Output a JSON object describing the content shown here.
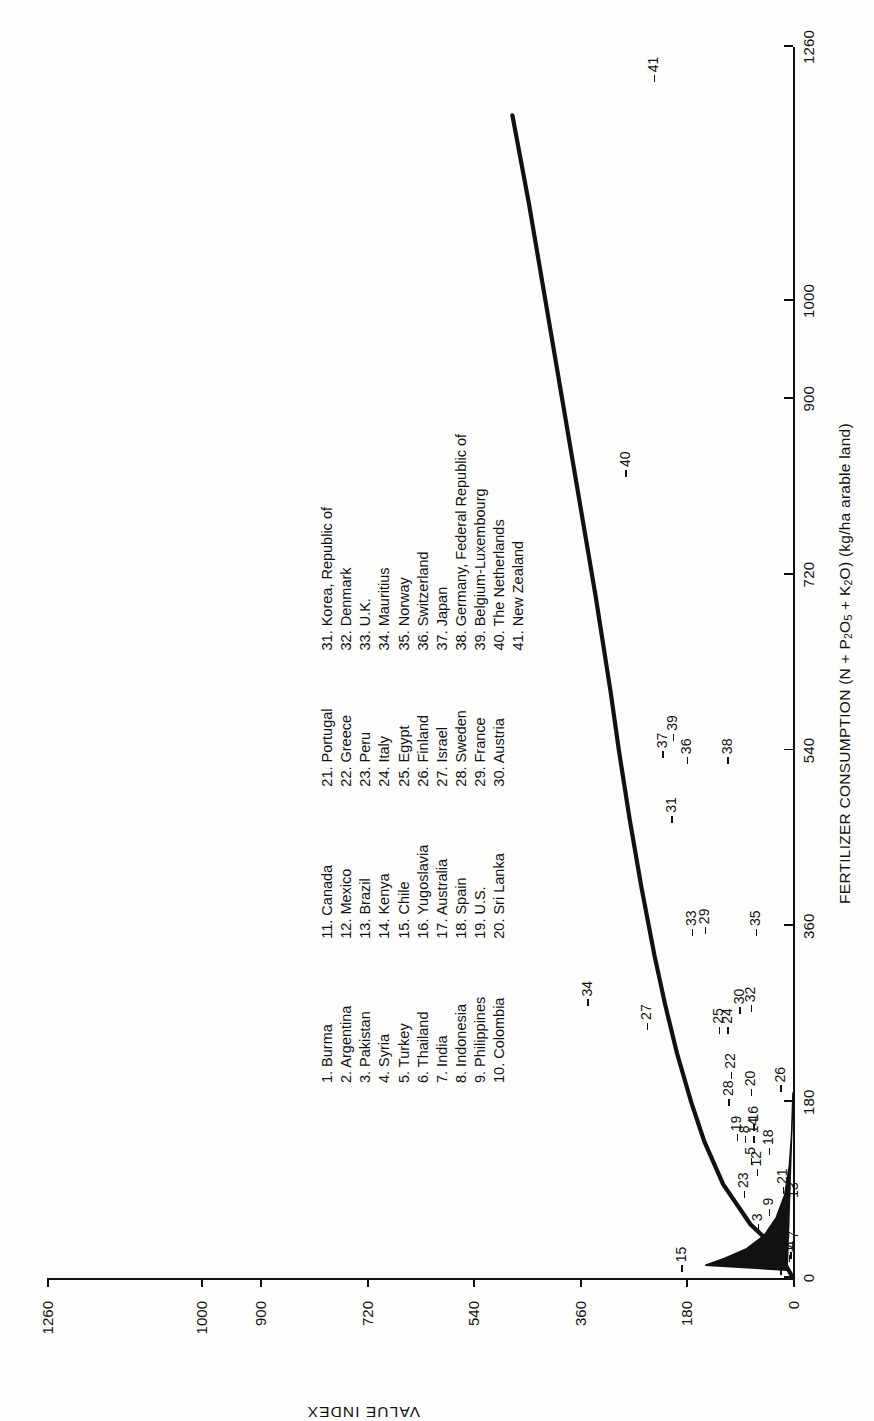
{
  "chart_data": {
    "type": "scatter",
    "title": "",
    "xlabel": "FERTILIZER CONSUMPTION (N + P2O5 + K2O) (kg/ha arable land)",
    "ylabel": "VALUE INDEX",
    "xticks": [
      0,
      180,
      360,
      540,
      720,
      900,
      1000,
      1260
    ],
    "yticks": [
      0,
      180,
      360,
      540,
      720,
      900,
      1000,
      1260
    ],
    "xlim": [
      0,
      1260
    ],
    "ylim": [
      0,
      1260
    ],
    "grid": false,
    "legend_position": "inside-center",
    "points": [
      {
        "id": 1,
        "label": "Burma",
        "x": 18,
        "y": 8
      },
      {
        "id": 2,
        "label": "Argentina",
        "x": 5,
        "y": 22
      },
      {
        "id": 3,
        "label": "Pakistan",
        "x": 50,
        "y": 60
      },
      {
        "id": 4,
        "label": "Syria",
        "x": 22,
        "y": 5
      },
      {
        "id": 5,
        "label": "Turkey",
        "x": 118,
        "y": 72
      },
      {
        "id": 6,
        "label": "Thailand",
        "x": 36,
        "y": 26
      },
      {
        "id": 7,
        "label": "India",
        "x": 32,
        "y": 0
      },
      {
        "id": 8,
        "label": "Indonesia",
        "x": 140,
        "y": 82
      },
      {
        "id": 9,
        "label": "Philippines",
        "x": 66,
        "y": 42
      },
      {
        "id": 10,
        "label": "Colombia",
        "x": 26,
        "y": 26
      },
      {
        "id": 11,
        "label": "Canada",
        "x": 34,
        "y": 20
      },
      {
        "id": 12,
        "label": "Mexico",
        "x": 106,
        "y": 62
      },
      {
        "id": 13,
        "label": "Brazil",
        "x": 74,
        "y": 0
      },
      {
        "id": 14,
        "label": "Kenya",
        "x": 140,
        "y": 68
      },
      {
        "id": 15,
        "label": "Chile",
        "x": 8,
        "y": 190
      },
      {
        "id": 16,
        "label": "Yugoslavia",
        "x": 152,
        "y": 68
      },
      {
        "id": 17,
        "label": "Australia",
        "x": 44,
        "y": 16
      },
      {
        "id": 18,
        "label": "Spain",
        "x": 128,
        "y": 42
      },
      {
        "id": 19,
        "label": "U.S.",
        "x": 142,
        "y": 96
      },
      {
        "id": 20,
        "label": "Sri Lanka",
        "x": 188,
        "y": 72
      },
      {
        "id": 21,
        "label": "Portugal",
        "x": 88,
        "y": 18
      },
      {
        "id": 22,
        "label": "Greece",
        "x": 206,
        "y": 106
      },
      {
        "id": 23,
        "label": "Peru",
        "x": 84,
        "y": 84
      },
      {
        "id": 24,
        "label": "Italy",
        "x": 252,
        "y": 112
      },
      {
        "id": 25,
        "label": "Egypt",
        "x": 252,
        "y": 126
      },
      {
        "id": 26,
        "label": "Finland",
        "x": 192,
        "y": 22
      },
      {
        "id": 27,
        "label": "Israel",
        "x": 256,
        "y": 248
      },
      {
        "id": 28,
        "label": "Sweden",
        "x": 178,
        "y": 110
      },
      {
        "id": 29,
        "label": "France",
        "x": 354,
        "y": 150
      },
      {
        "id": 30,
        "label": "Austria",
        "x": 272,
        "y": 92
      },
      {
        "id": 31,
        "label": "Korea, Republic of",
        "x": 468,
        "y": 206
      },
      {
        "id": 32,
        "label": "Denmark",
        "x": 274,
        "y": 72
      },
      {
        "id": 33,
        "label": "U.K.",
        "x": 352,
        "y": 172
      },
      {
        "id": 34,
        "label": "Mauritius",
        "x": 280,
        "y": 348
      },
      {
        "id": 35,
        "label": "Norway",
        "x": 352,
        "y": 64
      },
      {
        "id": 36,
        "label": "Switzerland",
        "x": 528,
        "y": 180
      },
      {
        "id": 37,
        "label": "Japan",
        "x": 534,
        "y": 222
      },
      {
        "id": 38,
        "label": "Germany, Federal Republic of",
        "x": 528,
        "y": 112
      },
      {
        "id": 39,
        "label": "Belgium-Luxembourg",
        "x": 552,
        "y": 204
      },
      {
        "id": 40,
        "label": "The Netherlands",
        "x": 822,
        "y": 284
      },
      {
        "id": 41,
        "label": "New Zealand",
        "x": 1226,
        "y": 236
      }
    ],
    "fit_curve": [
      [
        0,
        0
      ],
      [
        30,
        28
      ],
      [
        55,
        72
      ],
      [
        96,
        118
      ],
      [
        140,
        150
      ],
      [
        180,
        172
      ],
      [
        230,
        196
      ],
      [
        280,
        216
      ],
      [
        330,
        234
      ],
      [
        400,
        256
      ],
      [
        470,
        276
      ],
      [
        540,
        294
      ],
      [
        600,
        308
      ],
      [
        700,
        334
      ],
      [
        800,
        362
      ],
      [
        900,
        390
      ],
      [
        1000,
        418
      ],
      [
        1100,
        446
      ],
      [
        1190,
        474
      ]
    ],
    "origin_spike": [
      [
        8,
        10
      ],
      [
        13,
        148
      ],
      [
        20,
        116
      ],
      [
        30,
        78
      ],
      [
        44,
        48
      ],
      [
        62,
        28
      ],
      [
        85,
        14
      ],
      [
        115,
        6
      ],
      [
        150,
        2
      ],
      [
        190,
        0
      ]
    ]
  },
  "axes": {
    "x_title": "FERTILIZER CONSUMPTION (N + P",
    "x_title_sub1": "2",
    "x_title_mid": "O",
    "x_title_sub2": "5",
    "x_title_mid2": " + K",
    "x_title_sub3": "2",
    "x_title_end": "O) (kg/ha arable land)",
    "y_title": "VALUE INDEX",
    "x_tick_labels": [
      "0",
      "180",
      "360",
      "540",
      "720",
      "900",
      "1000",
      "1260"
    ],
    "y_tick_labels": [
      "0",
      "180",
      "360",
      "540",
      "720",
      "900",
      "1000",
      "1260"
    ]
  },
  "legend": {
    "columns": [
      {
        "items": [
          "1. Burma",
          "2. Argentina",
          "3. Pakistan",
          "4. Syria",
          "5. Turkey",
          "6. Thailand",
          "7. India",
          "8. Indonesia",
          "9. Philippines",
          "10. Colombia"
        ]
      },
      {
        "items": [
          "11. Canada",
          "12. Mexico",
          "13. Brazil",
          "14. Kenya",
          "15. Chile",
          "16. Yugoslavia",
          "17. Australia",
          "18. Spain",
          "19. U.S.",
          "20. Sri Lanka"
        ]
      },
      {
        "items": [
          "21. Portugal",
          "22. Greece",
          "23. Peru",
          "24. Italy",
          "25. Egypt",
          "26. Finland",
          "27. Israel",
          "28. Sweden",
          "29. France",
          "30. Austria"
        ]
      },
      {
        "items": [
          "31. Korea, Republic of",
          "32. Denmark",
          "33. U.K.",
          "34. Mauritius",
          "35. Norway",
          "36. Switzerland",
          "37. Japan",
          "38. Germany, Federal Republic of",
          "39. Belgium-Luxembourg",
          "40. The Netherlands",
          "41. New Zealand"
        ]
      }
    ]
  },
  "colors": {
    "ink": "#111111",
    "paper": "#fdfdfc"
  }
}
